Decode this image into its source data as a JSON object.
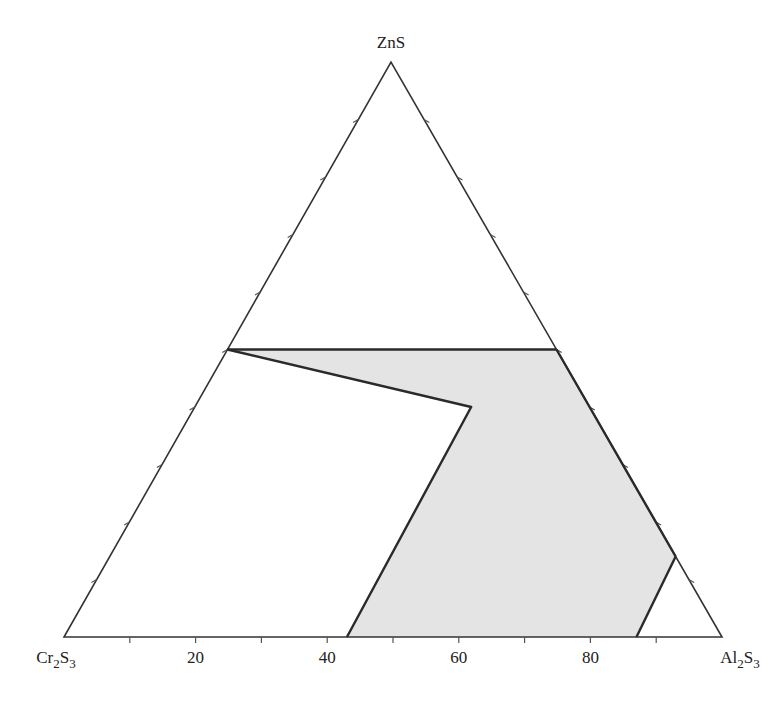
{
  "chart_data": {
    "type": "ternary",
    "title": "",
    "components": {
      "top": "ZnS",
      "left": "Cr2S3",
      "right": "Al2S3"
    },
    "vertex_labels": {
      "top": {
        "base": "ZnS",
        "parts": [
          {
            "t": "ZnS",
            "sub": false
          }
        ]
      },
      "left": {
        "parts": [
          {
            "t": "Cr",
            "sub": false
          },
          {
            "t": "2",
            "sub": true
          },
          {
            "t": "S",
            "sub": false
          },
          {
            "t": "3",
            "sub": true
          }
        ]
      },
      "right": {
        "parts": [
          {
            "t": "Al",
            "sub": false
          },
          {
            "t": "2",
            "sub": true
          },
          {
            "t": "S",
            "sub": false
          },
          {
            "t": "3",
            "sub": true
          }
        ]
      }
    },
    "axis": {
      "base_axis_component": "Al2S3",
      "unit": "mol %",
      "tick_step": 10,
      "tick_labels": [
        "20",
        "40",
        "60",
        "80"
      ],
      "tick_label_values": [
        20,
        40,
        60,
        80
      ],
      "ticks_on_all_sides": true
    },
    "boundary_lines": [
      {
        "name": "tie-line-50-ZnS",
        "points": [
          {
            "ZnS": 50,
            "Al2S3": 0
          },
          {
            "ZnS": 50,
            "Al2S3": 50
          }
        ]
      },
      {
        "name": "left-boundary",
        "points": [
          {
            "ZnS": 50,
            "Al2S3": 0
          },
          {
            "ZnS": 40,
            "Al2S3": 42
          },
          {
            "ZnS": 0,
            "Al2S3": 43
          }
        ]
      },
      {
        "name": "right-boundary",
        "points": [
          {
            "ZnS": 50,
            "Al2S3": 50
          },
          {
            "ZnS": 14,
            "Al2S3": 86
          }
        ]
      },
      {
        "name": "right-small-boundary",
        "points": [
          {
            "ZnS": 14,
            "Al2S3": 86
          },
          {
            "ZnS": 0,
            "Al2S3": 87
          }
        ]
      }
    ],
    "shaded_regions": [
      {
        "name": "single-phase-solid-solution",
        "fill": "#e4e4e4",
        "points": [
          {
            "ZnS": 50,
            "Al2S3": 0
          },
          {
            "ZnS": 50,
            "Al2S3": 50
          },
          {
            "ZnS": 14,
            "Al2S3": 86
          },
          {
            "ZnS": 0,
            "Al2S3": 87
          },
          {
            "ZnS": 0,
            "Al2S3": 43
          },
          {
            "ZnS": 40,
            "Al2S3": 42
          }
        ]
      }
    ]
  },
  "geometry": {
    "left_vertex": [
      64,
      637
    ],
    "right_vertex": [
      722,
      637
    ],
    "top_vertex": [
      391,
      62
    ]
  },
  "colors": {
    "line": "#2a2a2a",
    "edge": "#333333",
    "fill": "#e4e4e4",
    "background": "#ffffff"
  }
}
